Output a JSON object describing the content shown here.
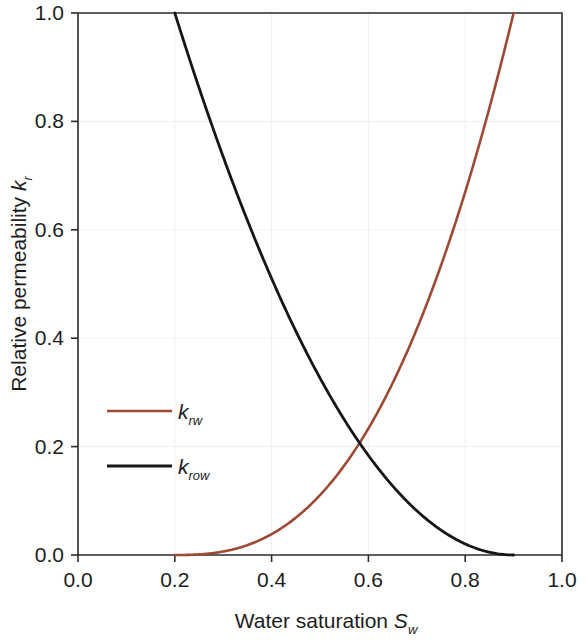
{
  "chart_data": {
    "type": "line",
    "title": "",
    "xlabel": "Water saturation S_w",
    "ylabel": "Relative permeability k_r",
    "xlabel_main": "Water saturation",
    "xlabel_symbol": "S",
    "xlabel_subscript": "w",
    "ylabel_main": "Relative permeability",
    "ylabel_symbol": "k",
    "ylabel_subscript": "r",
    "xlim": [
      0.0,
      1.0
    ],
    "ylim": [
      0.0,
      1.0
    ],
    "xticks": [
      0.0,
      0.2,
      0.4,
      0.6,
      0.8,
      1.0
    ],
    "xtick_labels": [
      "0.0",
      "0.2",
      "0.4",
      "0.6",
      "0.8",
      "1.0"
    ],
    "yticks": [
      0.0,
      0.2,
      0.4,
      0.6,
      0.8,
      1.0
    ],
    "ytick_labels": [
      "0.0",
      "0.2",
      "0.4",
      "0.6",
      "0.8",
      "1.0"
    ],
    "grid": true,
    "grid_color": "#f1f1f1",
    "legend_position": "center-left",
    "intersection": {
      "x": 0.63,
      "y": 0.26
    },
    "series": [
      {
        "name": "k_rw",
        "label_symbol": "k",
        "label_subscript": "rw",
        "color": "#9c4a36",
        "width": 2.6,
        "swc": 0.2,
        "sor": 0.1,
        "endpoint": 1.0,
        "exponent": 2.6,
        "x": [
          0.2,
          0.24,
          0.28,
          0.32,
          0.36,
          0.4,
          0.44,
          0.48,
          0.52,
          0.56,
          0.6,
          0.64,
          0.68,
          0.72,
          0.76,
          0.8,
          0.84,
          0.88,
          0.9
        ],
        "y": [
          0.0,
          0.003,
          0.012,
          0.028,
          0.051,
          0.082,
          0.122,
          0.171,
          0.229,
          0.297,
          0.375,
          0.463,
          0.562,
          0.672,
          0.793,
          0.925,
          1.0,
          1.0,
          1.0
        ]
      },
      {
        "name": "k_row",
        "label_symbol": "k",
        "label_subscript": "row",
        "color": "#161616",
        "width": 2.8,
        "swc": 0.2,
        "sor": 0.1,
        "endpoint": 1.0,
        "exponent": 2.0,
        "x": [
          0.2,
          0.24,
          0.28,
          0.32,
          0.36,
          0.4,
          0.44,
          0.48,
          0.52,
          0.56,
          0.6,
          0.64,
          0.68,
          0.72,
          0.76,
          0.8,
          0.84,
          0.88,
          0.9
        ],
        "y": [
          1.0,
          0.878,
          0.763,
          0.653,
          0.551,
          0.454,
          0.365,
          0.281,
          0.204,
          0.143,
          0.092,
          0.056,
          0.031,
          0.014,
          0.005,
          0.001,
          0.0,
          0.0,
          0.0
        ]
      }
    ],
    "legend_entries": [
      {
        "symbol": "k",
        "subscript": "rw",
        "color": "#9c4a36"
      },
      {
        "symbol": "k",
        "subscript": "row",
        "color": "#161616"
      }
    ]
  },
  "figure": {
    "background": "#ffffff",
    "axis_color": "#2b2b2b"
  }
}
